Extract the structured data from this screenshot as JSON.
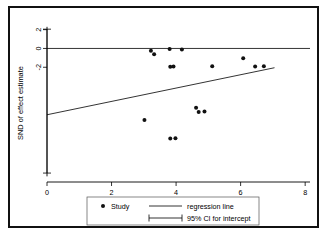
{
  "chart_data": {
    "type": "scatter",
    "title": "",
    "xlabel": "Precision",
    "ylabel": "SND of effect estimate",
    "xlim": [
      0,
      8.15
    ],
    "ylim": [
      -14.2,
      2.6
    ],
    "xticks": [
      "0",
      "2",
      "4",
      "6",
      "8"
    ],
    "xtick_values": [
      0,
      2,
      4,
      6,
      8
    ],
    "yticks": [
      "2",
      "0",
      "-2"
    ],
    "ytick_values": [
      2,
      0,
      -2
    ],
    "grid": false,
    "series": [
      {
        "name": "Study",
        "marker": "filled-circle",
        "points": [
          {
            "x": 3.22,
            "y": -0.25
          },
          {
            "x": 3.32,
            "y": -0.62
          },
          {
            "x": 3.8,
            "y": -0.05
          },
          {
            "x": 3.82,
            "y": -1.95
          },
          {
            "x": 3.92,
            "y": -1.92
          },
          {
            "x": 4.18,
            "y": -0.1
          },
          {
            "x": 5.12,
            "y": -1.88
          },
          {
            "x": 6.08,
            "y": -1.05
          },
          {
            "x": 6.45,
            "y": -1.92
          },
          {
            "x": 6.72,
            "y": -1.88
          },
          {
            "x": 4.62,
            "y": -6.3
          },
          {
            "x": 4.7,
            "y": -6.75
          },
          {
            "x": 4.88,
            "y": -6.7
          },
          {
            "x": 3.02,
            "y": -7.62
          },
          {
            "x": 3.82,
            "y": -9.58
          },
          {
            "x": 3.98,
            "y": -9.55
          }
        ]
      }
    ],
    "regression_line": {
      "name": "regression line",
      "x0": 0.0,
      "y0": -7.05,
      "x1": 7.05,
      "y1": -2.05
    },
    "reference_line": {
      "name": "zero-line",
      "y": 0,
      "x0": 0.0,
      "x1": 8.15
    },
    "ci_for_intercept": {
      "name": "95% CI for intercept",
      "x": 0.0,
      "low": -13.25,
      "high": 2.05
    },
    "legend_position": "below-center",
    "legend": [
      {
        "key": "study",
        "label": "Study",
        "marker": "dot"
      },
      {
        "key": "regression",
        "label": "regression line",
        "marker": "line"
      },
      {
        "key": "ci",
        "label": "95% CI for intercept",
        "marker": "capped-line"
      }
    ]
  }
}
